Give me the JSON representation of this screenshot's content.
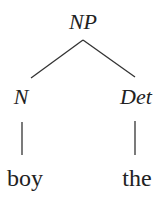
{
  "diagram": {
    "type": "syntax-tree",
    "root": {
      "label": "NP",
      "children": [
        {
          "label": "N",
          "children": [
            {
              "label": "boy"
            }
          ]
        },
        {
          "label": "Det",
          "children": [
            {
              "label": "the"
            }
          ]
        }
      ]
    },
    "nodes": {
      "np": "NP",
      "n": "N",
      "det": "Det",
      "boy": "boy",
      "the": "the"
    },
    "colors": {
      "text": "#222222",
      "lines": "#333333",
      "background": "#ffffff"
    }
  }
}
